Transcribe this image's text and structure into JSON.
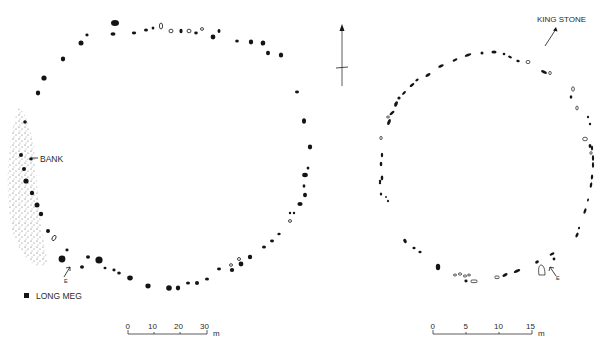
{
  "figure": {
    "north_arrow": {
      "icon": "north-arrow-icon"
    }
  },
  "left_plan": {
    "labels": {
      "bank": "BANK",
      "entrance": "E",
      "outlier": "LONG MEG"
    },
    "scale_bar": {
      "ticks": [
        "0",
        "10",
        "20",
        "30"
      ],
      "unit": "m"
    }
  },
  "right_plan": {
    "labels": {
      "outlier": "KING STONE",
      "entrance": "E"
    },
    "scale_bar": {
      "ticks": [
        "0",
        "5",
        "10",
        "15"
      ],
      "unit": "m"
    }
  },
  "legend": {
    "filled_stone": "standing / solid stone",
    "open_stone": "fallen / outline stone"
  },
  "colors": {
    "ink": "#141414",
    "stipple": "#555555",
    "background": "#ffffff"
  }
}
